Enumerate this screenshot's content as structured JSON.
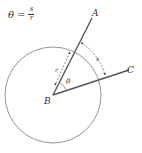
{
  "formula": {
    "lhs": "θ",
    "equals": "=",
    "numerator": "s",
    "denominator": "r"
  },
  "diagram": {
    "center_label": "B",
    "ray1_label": "A",
    "ray2_label": "C",
    "angle_label": "θ",
    "radius_label": "r",
    "arc_label": "s",
    "colors": {
      "circle": "#777777",
      "rays": "#555555",
      "text": "#333333"
    }
  }
}
